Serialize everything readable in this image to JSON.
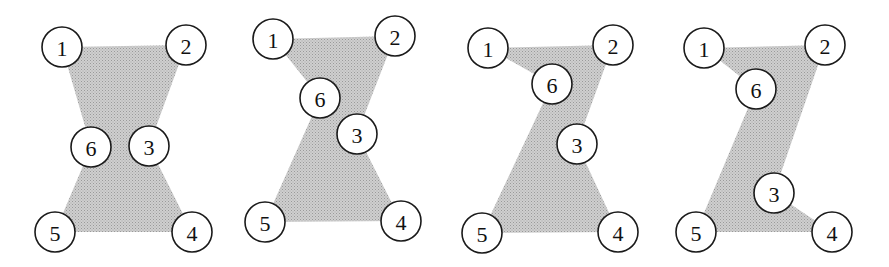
{
  "colors": {
    "fill": "#c4c4c4",
    "fill_dot": "#9a9a9a",
    "stroke": "#1a1a1a",
    "background": "#ffffff"
  },
  "node_radius": 20,
  "panels": [
    {
      "name": "panel-1",
      "polygon": "62,47 186,45 149,146 192,232 55,232 91,147",
      "nodes": [
        {
          "label": "1",
          "x": 62,
          "y": 47
        },
        {
          "label": "2",
          "x": 186,
          "y": 45
        },
        {
          "label": "3",
          "x": 149,
          "y": 146
        },
        {
          "label": "4",
          "x": 192,
          "y": 232
        },
        {
          "label": "5",
          "x": 55,
          "y": 232
        },
        {
          "label": "6",
          "x": 91,
          "y": 147
        }
      ]
    },
    {
      "name": "panel-2",
      "polygon": "273,39 395,36 357,134 401,221 265,222 320,98",
      "nodes": [
        {
          "label": "1",
          "x": 273,
          "y": 39
        },
        {
          "label": "2",
          "x": 395,
          "y": 36
        },
        {
          "label": "3",
          "x": 357,
          "y": 134
        },
        {
          "label": "4",
          "x": 401,
          "y": 221
        },
        {
          "label": "5",
          "x": 265,
          "y": 222
        },
        {
          "label": "6",
          "x": 320,
          "y": 98
        }
      ]
    },
    {
      "name": "panel-3",
      "polygon": "488,48 613,45 577,144 618,232 482,233 552,84",
      "nodes": [
        {
          "label": "1",
          "x": 488,
          "y": 48
        },
        {
          "label": "2",
          "x": 613,
          "y": 45
        },
        {
          "label": "3",
          "x": 577,
          "y": 144
        },
        {
          "label": "4",
          "x": 618,
          "y": 232
        },
        {
          "label": "5",
          "x": 482,
          "y": 233
        },
        {
          "label": "6",
          "x": 552,
          "y": 84
        }
      ]
    },
    {
      "name": "panel-4",
      "polygon": "704,48 825,45 774,193 832,232 696,232 756,89",
      "nodes": [
        {
          "label": "1",
          "x": 704,
          "y": 48
        },
        {
          "label": "2",
          "x": 825,
          "y": 45
        },
        {
          "label": "3",
          "x": 774,
          "y": 193
        },
        {
          "label": "4",
          "x": 832,
          "y": 232
        },
        {
          "label": "5",
          "x": 696,
          "y": 232
        },
        {
          "label": "6",
          "x": 756,
          "y": 89
        }
      ]
    }
  ]
}
